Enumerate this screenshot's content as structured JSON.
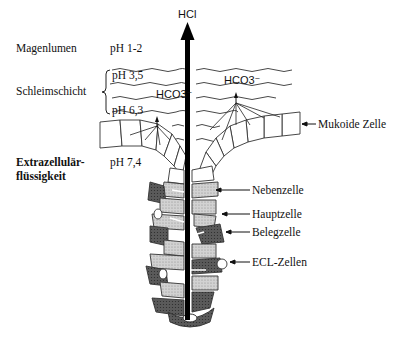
{
  "diagram": {
    "top_label": "HCl",
    "zones": [
      {
        "name": "Magenlumen",
        "ph": "pH 1-2"
      },
      {
        "name": "Schleimschicht",
        "ph_top": "pH 3,5",
        "ph_bottom": "pH 6,3"
      },
      {
        "name_line1": "Extrazellulär-",
        "name_line2": "flüssigkeit",
        "ph": "pH 7,4"
      }
    ],
    "secretions": {
      "left": "HCO3⁻",
      "right": "HCO3⁻"
    },
    "cell_labels": [
      "Mukoide Zelle",
      "Nebenzelle",
      "Hauptzelle",
      "Belegzelle",
      "ECL-Zellen"
    ],
    "colors": {
      "ink": "#111111",
      "light_cell": "#c8c8c8",
      "dark_cell": "#555555",
      "background": "#ffffff"
    }
  }
}
